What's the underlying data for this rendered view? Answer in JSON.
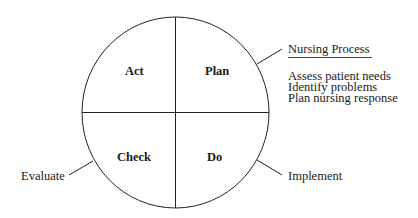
{
  "diagram": {
    "type": "PDCA cycle mapped to nursing process",
    "quadrants": [
      {
        "position": "top-left",
        "label": "Act"
      },
      {
        "position": "top-right",
        "label": "Plan"
      },
      {
        "position": "bottom-left",
        "label": "Check"
      },
      {
        "position": "bottom-right",
        "label": "Do"
      }
    ],
    "annotations": {
      "plan": {
        "title": "Nursing Process",
        "lines": [
          "Assess patient needs",
          "Identify problems",
          "Plan nursing response"
        ]
      },
      "check": {
        "label": "Evaluate"
      },
      "do": {
        "label": "Implement"
      }
    },
    "colors": {
      "line": "#222222",
      "text": "#1a1a1a",
      "background": "#ffffff"
    }
  }
}
